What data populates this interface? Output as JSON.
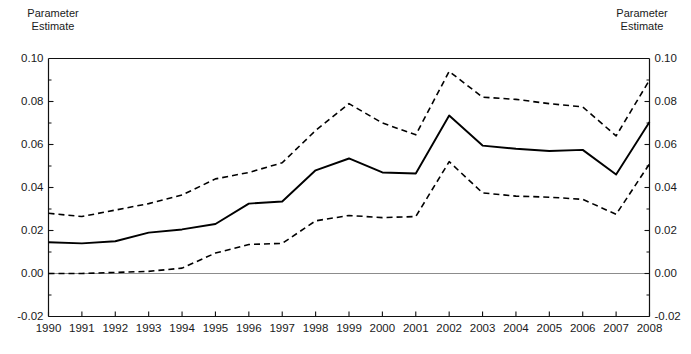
{
  "figure": {
    "left_caption": "Parameter\nEstimate",
    "right_caption": "Parameter\nEstimate"
  },
  "chart_data": {
    "type": "line",
    "title": "",
    "subtitle": "",
    "xlabel": "",
    "ylabel": "Parameter Estimate",
    "y2label": "Parameter Estimate",
    "grid": false,
    "legend": "none",
    "xlim": [
      1990,
      2008
    ],
    "ylim": [
      -0.02,
      0.1
    ],
    "ytick_labels": [
      "0.10",
      "0.08",
      "0.06",
      "0.04",
      "0.02",
      "0.00",
      "-0.02"
    ],
    "ytick_values": [
      0.1,
      0.08,
      0.06,
      0.04,
      0.02,
      0.0,
      -0.02
    ],
    "y_minor_ticks": [
      0.09,
      0.07,
      0.05,
      0.03,
      0.01,
      -0.01
    ],
    "zero_line": 0.0,
    "categories": [
      1990,
      1991,
      1992,
      1993,
      1994,
      1995,
      1996,
      1997,
      1998,
      1999,
      2000,
      2001,
      2002,
      2003,
      2004,
      2005,
      2006,
      2007,
      2008
    ],
    "xtick_labels": [
      "1990",
      "1991",
      "1992",
      "1993",
      "1994",
      "1995",
      "1996",
      "1997",
      "1998",
      "1999",
      "2000",
      "2001",
      "2002",
      "2003",
      "2004",
      "2005",
      "2006",
      "2007",
      "2008"
    ],
    "series": [
      {
        "name": "Upper confidence bound",
        "style": "dashed",
        "color": "#000000",
        "values": [
          0.028,
          0.0265,
          0.0295,
          0.0325,
          0.0365,
          0.044,
          0.047,
          0.0515,
          0.0665,
          0.079,
          0.07,
          0.0645,
          0.094,
          0.082,
          0.081,
          0.079,
          0.0775,
          0.064,
          0.09
        ]
      },
      {
        "name": "Parameter estimate",
        "style": "solid",
        "color": "#000000",
        "values": [
          0.0145,
          0.014,
          0.015,
          0.019,
          0.0205,
          0.023,
          0.0325,
          0.0335,
          0.048,
          0.0535,
          0.047,
          0.0465,
          0.0735,
          0.0595,
          0.058,
          0.057,
          0.0575,
          0.046,
          0.0705
        ]
      },
      {
        "name": "Lower confidence bound",
        "style": "dashed",
        "color": "#000000",
        "values": [
          0.0,
          0.0,
          0.0005,
          0.001,
          0.0025,
          0.0095,
          0.0135,
          0.014,
          0.0245,
          0.027,
          0.026,
          0.0265,
          0.052,
          0.0375,
          0.036,
          0.0355,
          0.0345,
          0.0275,
          0.051
        ]
      }
    ]
  }
}
